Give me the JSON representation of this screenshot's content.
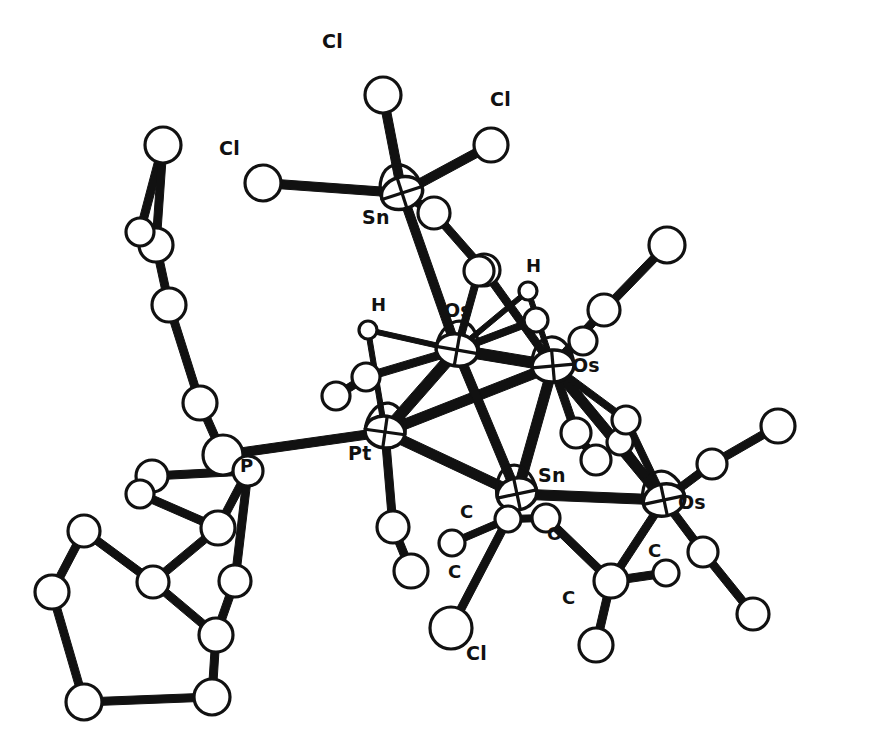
{
  "figure": {
    "kind": "ortep-molecular-structure",
    "background_color": "#ffffff",
    "line_color": "#111111",
    "atom_fill_color": "#ffffff",
    "width": 878,
    "height": 748
  },
  "chart_data": {
    "type": "scatter",
    "title": "",
    "subtitle": "",
    "xlabel": "",
    "ylabel": "",
    "grid": false,
    "legend": "none",
    "xlim": [
      0,
      878
    ],
    "ylim": [
      0,
      748
    ],
    "labels": [
      {
        "text": "Cl",
        "x": 219,
        "y": 155
      },
      {
        "text": "Cl",
        "x": 322,
        "y": 48
      },
      {
        "text": "Cl",
        "x": 490,
        "y": 106
      },
      {
        "text": "Sn",
        "x": 362,
        "y": 224
      },
      {
        "text": "H",
        "x": 371,
        "y": 311
      },
      {
        "text": "Os",
        "x": 444,
        "y": 317
      },
      {
        "text": "H",
        "x": 526,
        "y": 272
      },
      {
        "text": "Os",
        "x": 572,
        "y": 372
      },
      {
        "text": "P",
        "x": 240,
        "y": 472
      },
      {
        "text": "Pt",
        "x": 348,
        "y": 460
      },
      {
        "text": "Sn",
        "x": 538,
        "y": 482
      },
      {
        "text": "Os",
        "x": 678,
        "y": 509
      },
      {
        "text": "C",
        "x": 460,
        "y": 518
      },
      {
        "text": "C",
        "x": 448,
        "y": 578
      },
      {
        "text": "O",
        "x": 547,
        "y": 540
      },
      {
        "text": "C",
        "x": 562,
        "y": 604
      },
      {
        "text": "C",
        "x": 648,
        "y": 557
      },
      {
        "text": "Cl",
        "x": 466,
        "y": 660
      }
    ],
    "atoms": [
      {
        "id": "sn1",
        "label": "Sn",
        "x": 402,
        "y": 193,
        "rx": 21,
        "ry": 16,
        "rot": -18,
        "type": "ellipse"
      },
      {
        "id": "cl1",
        "label": "Cl",
        "x": 383,
        "y": 95,
        "r": 18
      },
      {
        "id": "cl2",
        "label": "Cl",
        "x": 263,
        "y": 183,
        "r": 18
      },
      {
        "id": "cl3",
        "label": "Cl",
        "x": 491,
        "y": 145,
        "r": 17
      },
      {
        "id": "c_sn_a",
        "label": "C",
        "x": 434,
        "y": 213,
        "r": 16
      },
      {
        "id": "c_sn_b",
        "label": "C",
        "x": 484,
        "y": 270,
        "r": 16
      },
      {
        "id": "os1",
        "label": "Os",
        "x": 457,
        "y": 350,
        "rx": 21,
        "ry": 16,
        "rot": 10,
        "type": "ellipse"
      },
      {
        "id": "os2",
        "label": "Os",
        "x": 553,
        "y": 366,
        "rx": 21,
        "ry": 16,
        "rot": -5,
        "type": "ellipse"
      },
      {
        "id": "os3",
        "label": "Os",
        "x": 664,
        "y": 500,
        "rx": 21,
        "ry": 16,
        "rot": -12,
        "type": "ellipse"
      },
      {
        "id": "pt1",
        "label": "Pt",
        "x": 385,
        "y": 432,
        "rx": 20,
        "ry": 16,
        "rot": 8,
        "type": "ellipse"
      },
      {
        "id": "sn2",
        "label": "Sn",
        "x": 517,
        "y": 494,
        "rx": 20,
        "ry": 16,
        "rot": -12,
        "type": "ellipse"
      },
      {
        "id": "p1",
        "label": "P",
        "x": 223,
        "y": 455,
        "r": 20
      },
      {
        "id": "h1",
        "label": "H",
        "x": 368,
        "y": 330,
        "r": 9
      },
      {
        "id": "h2",
        "label": "H",
        "x": 528,
        "y": 291,
        "r": 9
      },
      {
        "id": "co1c",
        "label": "C",
        "x": 366,
        "y": 377,
        "r": 14
      },
      {
        "id": "co1o",
        "label": "O",
        "x": 336,
        "y": 396,
        "r": 14
      },
      {
        "id": "co2c",
        "label": "C",
        "x": 479,
        "y": 271,
        "r": 15
      },
      {
        "id": "co2o",
        "label": "O",
        "x": 500,
        "y": 216,
        "r": 0
      },
      {
        "id": "co3c",
        "label": "C",
        "x": 536,
        "y": 320,
        "r": 12
      },
      {
        "id": "co3o",
        "label": "O",
        "x": 533,
        "y": 296,
        "r": 0
      },
      {
        "id": "co4c",
        "label": "C",
        "x": 604,
        "y": 310,
        "r": 16
      },
      {
        "id": "co4o",
        "label": "O",
        "x": 667,
        "y": 245,
        "r": 18
      },
      {
        "id": "co5c",
        "label": "C",
        "x": 583,
        "y": 341,
        "r": 14
      },
      {
        "id": "co6c",
        "label": "C",
        "x": 576,
        "y": 433,
        "r": 15
      },
      {
        "id": "co6o",
        "label": "O",
        "x": 596,
        "y": 460,
        "r": 15
      },
      {
        "id": "co7c",
        "label": "C",
        "x": 620,
        "y": 442,
        "r": 13
      },
      {
        "id": "co8c",
        "label": "C",
        "x": 712,
        "y": 464,
        "r": 15
      },
      {
        "id": "co8o",
        "label": "O",
        "x": 778,
        "y": 426,
        "r": 17
      },
      {
        "id": "co9c",
        "label": "C",
        "x": 703,
        "y": 552,
        "r": 15
      },
      {
        "id": "co9o",
        "label": "O",
        "x": 753,
        "y": 614,
        "r": 16
      },
      {
        "id": "co10c",
        "label": "C",
        "x": 626,
        "y": 420,
        "r": 14
      },
      {
        "id": "co10o",
        "label": "O",
        "x": 630,
        "y": 385,
        "r": 0
      },
      {
        "id": "ptc1",
        "label": "C",
        "x": 393,
        "y": 527,
        "r": 16
      },
      {
        "id": "pto1",
        "label": "O",
        "x": 411,
        "y": 571,
        "r": 17
      },
      {
        "id": "snme",
        "label": "C",
        "x": 452,
        "y": 543,
        "r": 13
      },
      {
        "id": "sncl",
        "label": "Cl",
        "x": 451,
        "y": 628,
        "r": 21
      },
      {
        "id": "snoc",
        "label": "O",
        "x": 546,
        "y": 518,
        "r": 14
      },
      {
        "id": "snome",
        "label": "C",
        "x": 611,
        "y": 581,
        "r": 17
      },
      {
        "id": "snome_h1",
        "label": "C",
        "x": 666,
        "y": 573,
        "r": 13
      },
      {
        "id": "snome_h2",
        "label": "C",
        "x": 596,
        "y": 645,
        "r": 17
      },
      {
        "id": "sn2_sub",
        "label": "C",
        "x": 508,
        "y": 519,
        "r": 13
      },
      {
        "id": "cyA1",
        "label": "C",
        "x": 248,
        "y": 471,
        "r": 15
      },
      {
        "id": "cyA2",
        "label": "C",
        "x": 152,
        "y": 476,
        "r": 16
      },
      {
        "id": "cyA3",
        "label": "C",
        "x": 140,
        "y": 494,
        "r": 14
      },
      {
        "id": "cyA4",
        "label": "C",
        "x": 218,
        "y": 528,
        "r": 17
      },
      {
        "id": "cyA5",
        "label": "C",
        "x": 235,
        "y": 581,
        "r": 16
      },
      {
        "id": "cyA6",
        "label": "C",
        "x": 236,
        "y": 577,
        "r": 0
      },
      {
        "id": "cyB1",
        "label": "C",
        "x": 84,
        "y": 531,
        "r": 16
      },
      {
        "id": "cyB2",
        "label": "C",
        "x": 52,
        "y": 592,
        "r": 17
      },
      {
        "id": "cyB3",
        "label": "C",
        "x": 84,
        "y": 702,
        "r": 18
      },
      {
        "id": "cyB4",
        "label": "C",
        "x": 212,
        "y": 697,
        "r": 18
      },
      {
        "id": "cyB5",
        "label": "C",
        "x": 216,
        "y": 635,
        "r": 17
      },
      {
        "id": "cyB6",
        "label": "C",
        "x": 153,
        "y": 582,
        "r": 16
      },
      {
        "id": "cyC1",
        "label": "C",
        "x": 169,
        "y": 305,
        "r": 17
      },
      {
        "id": "cyC2",
        "label": "C",
        "x": 156,
        "y": 245,
        "r": 17
      },
      {
        "id": "cyC3",
        "label": "C",
        "x": 140,
        "y": 232,
        "r": 14
      },
      {
        "id": "cyC4",
        "label": "C",
        "x": 163,
        "y": 145,
        "r": 18
      },
      {
        "id": "cyC5",
        "label": "C",
        "x": 200,
        "y": 403,
        "r": 17
      },
      {
        "id": "cyC6",
        "label": "C",
        "x": 196,
        "y": 391,
        "r": 0
      },
      {
        "id": "cyD1",
        "label": "C",
        "x": 230,
        "y": 285,
        "r": 0
      },
      {
        "id": "cyD2",
        "label": "C",
        "x": 187,
        "y": 345,
        "r": 0
      }
    ],
    "bonds": [
      {
        "a": "sn1",
        "b": "cl1",
        "w": 9
      },
      {
        "a": "sn1",
        "b": "cl2",
        "w": 9
      },
      {
        "a": "sn1",
        "b": "cl3",
        "w": 9
      },
      {
        "a": "sn1",
        "b": "os1",
        "w": 9
      },
      {
        "a": "sn1",
        "b": "c_sn_a",
        "w": 8
      },
      {
        "a": "c_sn_a",
        "b": "c_sn_b",
        "w": 8
      },
      {
        "a": "c_sn_b",
        "b": "os2",
        "w": 8
      },
      {
        "a": "os1",
        "b": "os2",
        "w": 11
      },
      {
        "a": "os1",
        "b": "pt1",
        "w": 11
      },
      {
        "a": "os2",
        "b": "pt1",
        "w": 10
      },
      {
        "a": "os2",
        "b": "os3",
        "w": 10
      },
      {
        "a": "os2",
        "b": "sn2",
        "w": 10
      },
      {
        "a": "pt1",
        "b": "sn2",
        "w": 10
      },
      {
        "a": "os1",
        "b": "sn2",
        "w": 9
      },
      {
        "a": "sn2",
        "b": "os3",
        "w": 10
      },
      {
        "a": "os1",
        "b": "h1",
        "w": 5
      },
      {
        "a": "pt1",
        "b": "h1",
        "w": 5
      },
      {
        "a": "os2",
        "b": "h2",
        "w": 5
      },
      {
        "a": "os1",
        "b": "h2",
        "w": 5
      },
      {
        "a": "os1",
        "b": "co1c",
        "w": 8
      },
      {
        "a": "co1c",
        "b": "co1o",
        "w": 8
      },
      {
        "a": "os1",
        "b": "co2c",
        "w": 7
      },
      {
        "a": "os1",
        "b": "co3c",
        "w": 7
      },
      {
        "a": "os2",
        "b": "co4c",
        "w": 8
      },
      {
        "a": "co4c",
        "b": "co4o",
        "w": 8
      },
      {
        "a": "os2",
        "b": "co5c",
        "w": 6
      },
      {
        "a": "os2",
        "b": "co6c",
        "w": 8
      },
      {
        "a": "co6c",
        "b": "co6o",
        "w": 8
      },
      {
        "a": "os2",
        "b": "co10c",
        "w": 7
      },
      {
        "a": "os3",
        "b": "co8c",
        "w": 8
      },
      {
        "a": "co8c",
        "b": "co8o",
        "w": 8
      },
      {
        "a": "os3",
        "b": "co9c",
        "w": 8
      },
      {
        "a": "co9c",
        "b": "co9o",
        "w": 8
      },
      {
        "a": "os3",
        "b": "co7c",
        "w": 7
      },
      {
        "a": "os3",
        "b": "snome",
        "w": 8
      },
      {
        "a": "os3",
        "b": "co10c",
        "w": 7
      },
      {
        "a": "pt1",
        "b": "ptc1",
        "w": 8
      },
      {
        "a": "ptc1",
        "b": "pto1",
        "w": 8
      },
      {
        "a": "pt1",
        "b": "p1",
        "w": 9
      },
      {
        "a": "sn2",
        "b": "sn2_sub",
        "w": 8
      },
      {
        "a": "sn2_sub",
        "b": "snme",
        "w": 7
      },
      {
        "a": "sn2_sub",
        "b": "sncl",
        "w": 8
      },
      {
        "a": "sn2_sub",
        "b": "snoc",
        "w": 7
      },
      {
        "a": "snoc",
        "b": "snome",
        "w": 8
      },
      {
        "a": "snome",
        "b": "snome_h1",
        "w": 8
      },
      {
        "a": "snome",
        "b": "snome_h2",
        "w": 8
      },
      {
        "a": "p1",
        "b": "cyA1",
        "w": 9
      },
      {
        "a": "cyA1",
        "b": "cyA2",
        "w": 8
      },
      {
        "a": "cyA2",
        "b": "cyA3",
        "w": 8
      },
      {
        "a": "cyA3",
        "b": "cyA4",
        "w": 8
      },
      {
        "a": "cyA4",
        "b": "cyA1",
        "w": 8
      },
      {
        "a": "cyA4",
        "b": "cyB6",
        "w": 8
      },
      {
        "a": "cyA1",
        "b": "cyA5",
        "w": 8
      },
      {
        "a": "cyA5",
        "b": "cyB5",
        "w": 8
      },
      {
        "a": "cyB6",
        "b": "cyB1",
        "w": 8
      },
      {
        "a": "cyB1",
        "b": "cyB2",
        "w": 8
      },
      {
        "a": "cyB2",
        "b": "cyB3",
        "w": 8
      },
      {
        "a": "cyB3",
        "b": "cyB4",
        "w": 8
      },
      {
        "a": "cyB4",
        "b": "cyB5",
        "w": 8
      },
      {
        "a": "cyB5",
        "b": "cyB6",
        "w": 8
      },
      {
        "a": "p1",
        "b": "cyC5",
        "w": 8
      },
      {
        "a": "cyC5",
        "b": "cyC1",
        "w": 8
      },
      {
        "a": "cyC1",
        "b": "cyC2",
        "w": 8
      },
      {
        "a": "cyC2",
        "b": "cyC3",
        "w": 8
      },
      {
        "a": "cyC3",
        "b": "cyC4",
        "w": 8
      },
      {
        "a": "cyC4",
        "b": "cyC2",
        "w": 8
      }
    ]
  }
}
